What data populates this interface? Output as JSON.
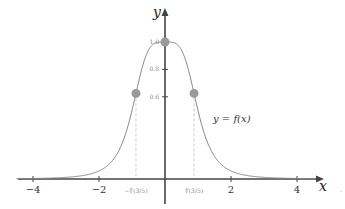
{
  "chart_data": {
    "type": "line",
    "title": "",
    "function_label": "y = f(x)",
    "xlabel": "x",
    "ylabel": "y",
    "xlim": [
      -4.5,
      4.6
    ],
    "ylim": [
      0,
      1.1
    ],
    "x_ticks": [
      {
        "value": -4,
        "label": "−4"
      },
      {
        "value": -2,
        "label": "−2"
      },
      {
        "value": 2,
        "label": "2"
      },
      {
        "value": 4,
        "label": "4"
      }
    ],
    "special_x_ticks": [
      {
        "value": -0.88,
        "label": "−∜(3/5)"
      },
      {
        "value": 0.88,
        "label": "∜(3/5)"
      }
    ],
    "y_ticks": [
      {
        "value": 0.6,
        "label": "0.6"
      },
      {
        "value": 0.8,
        "label": "0.8"
      },
      {
        "value": 1.0,
        "label": "1.0"
      }
    ],
    "series": [
      {
        "name": "f(x) = 1/(1+x^4)",
        "color": "#888888",
        "x": [
          -4.5,
          -4,
          -3.5,
          -3,
          -2.5,
          -2,
          -1.5,
          -1.25,
          -1,
          -0.88,
          -0.75,
          -0.5,
          -0.25,
          0,
          0.25,
          0.5,
          0.75,
          0.88,
          1,
          1.25,
          1.5,
          2,
          2.5,
          3,
          3.5,
          4,
          4.5
        ],
        "y": [
          0.0024,
          0.0039,
          0.0066,
          0.0122,
          0.025,
          0.0588,
          0.1649,
          0.2907,
          0.5,
          0.625,
          0.7596,
          0.9412,
          0.9961,
          1.0,
          0.9961,
          0.9412,
          0.7596,
          0.625,
          0.5,
          0.2907,
          0.1649,
          0.0588,
          0.025,
          0.0122,
          0.0066,
          0.0039,
          0.0024
        ]
      }
    ],
    "points": [
      {
        "x": 0,
        "y": 1.0,
        "color": "#999999"
      },
      {
        "x": -0.88,
        "y": 0.625,
        "color": "#999999"
      },
      {
        "x": 0.88,
        "y": 0.625,
        "color": "#999999"
      }
    ],
    "grid": false,
    "legend": "none"
  }
}
